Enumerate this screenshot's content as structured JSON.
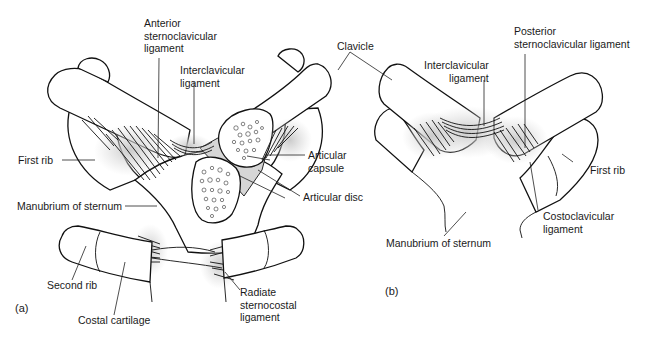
{
  "figure": {
    "panel_a": {
      "tag": "(a)",
      "labels": {
        "anterior_sc_ligament": [
          "Anterior",
          "sternoclavicular",
          "ligament"
        ],
        "interclavicular_ligament": [
          "Interclavicular",
          "ligament"
        ],
        "clavicle": "Clavicle",
        "first_rib": "First rib",
        "articular_capsule": [
          "Articular",
          "capsule"
        ],
        "articular_disc": "Articular disc",
        "manubrium": "Manubrium of sternum",
        "second_rib": "Second rib",
        "costal_cartilage": "Costal cartilage",
        "radiate_ligament": [
          "Radiate",
          "sternocostal",
          "ligament"
        ]
      }
    },
    "panel_b": {
      "tag": "(b)",
      "labels": {
        "interclavicular_ligament": [
          "Interclavicular",
          "ligament"
        ],
        "posterior_sc_ligament": [
          "Posterior",
          "sternoclavicular ligament"
        ],
        "first_rib": "First rib",
        "costoclavicular_ligament": [
          "Costoclavicular",
          "ligament"
        ],
        "manubrium": "Manubrium of sternum"
      }
    },
    "colors": {
      "line": "#111111",
      "ligament_shade": "#d0d0d0",
      "background": "#ffffff"
    }
  }
}
